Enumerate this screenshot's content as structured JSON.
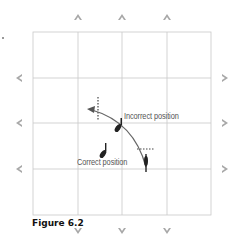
{
  "figure": {
    "caption": "Figure 6.2",
    "labels": {
      "incorrect": "Incorrect position",
      "correct": "Correct position"
    },
    "colors": {
      "grid": "#c8c8c8",
      "arrow_markers": "#9a9a9a",
      "path": "#666666",
      "figure": "#222222",
      "text": "#555555"
    },
    "grid": {
      "columns": 4,
      "rows": 4
    },
    "edge_markers": {
      "top": [
        "up-arrow",
        "up-arrow",
        "up-arrow"
      ],
      "bottom": [
        "down-arrow",
        "down-arrow",
        "down-arrow"
      ],
      "left": [
        "left-arrow",
        "left-arrow",
        "left-arrow"
      ],
      "right": [
        "right-arrow",
        "right-arrow",
        "right-arrow"
      ]
    }
  }
}
